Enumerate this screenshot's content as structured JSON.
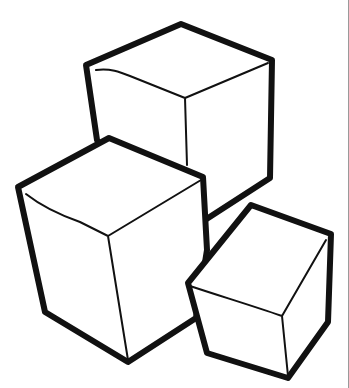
{
  "illustration": {
    "subject": "three cubes line drawing",
    "colors": {
      "ink": "#111111",
      "paper": "#ffffff",
      "edge": "#9a9a9a"
    },
    "cubes": [
      {
        "name": "top-back-cube",
        "position": "top center"
      },
      {
        "name": "left-front-cube",
        "position": "lower left"
      },
      {
        "name": "small-right-cube",
        "position": "lower right"
      }
    ]
  }
}
